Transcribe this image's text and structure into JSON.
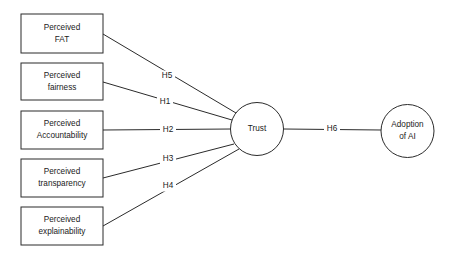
{
  "diagram": {
    "background_color": "#ffffff",
    "line_color": "#2b2b2b",
    "text_color": "#1a1a1a",
    "exogenous_boxes": [
      {
        "id": "perceived-fat",
        "line1": "Perceived",
        "line2": "FAT",
        "x": 21,
        "y": 14,
        "w": 82,
        "h": 39
      },
      {
        "id": "perceived-fairness",
        "line1": "Perceived",
        "line2": "fairness",
        "x": 21,
        "y": 63,
        "w": 82,
        "h": 37
      },
      {
        "id": "perceived-accountability",
        "line1": "Perceived",
        "line2": "Accountability",
        "x": 21,
        "y": 111,
        "w": 82,
        "h": 38
      },
      {
        "id": "perceived-transparency",
        "line1": "Perceived",
        "line2": "transparency",
        "x": 21,
        "y": 159,
        "w": 82,
        "h": 38
      },
      {
        "id": "perceived-explainability",
        "line1": "Perceived",
        "line2": "explainability",
        "x": 21,
        "y": 207,
        "w": 82,
        "h": 38
      }
    ],
    "circles": [
      {
        "id": "trust",
        "line1": "Trust",
        "line2": "",
        "cx": 257,
        "cy": 129,
        "r": 26.5
      },
      {
        "id": "adoption-of-ai",
        "line1": "Adoption",
        "line2": "of AI",
        "cx": 407.5,
        "cy": 131,
        "r": 26.5
      }
    ],
    "paths": [
      {
        "id": "h5",
        "label": "H5",
        "x1": 103,
        "y1": 34,
        "x2": 236,
        "y2": 113,
        "lx": 167,
        "ly": 76
      },
      {
        "id": "h1",
        "label": "H1",
        "x1": 103,
        "y1": 82,
        "x2": 232,
        "y2": 120,
        "lx": 165,
        "ly": 102
      },
      {
        "id": "h2",
        "label": "H2",
        "x1": 103,
        "y1": 130,
        "x2": 231,
        "y2": 129,
        "lx": 168,
        "ly": 130
      },
      {
        "id": "h3",
        "label": "H3",
        "x1": 103,
        "y1": 178,
        "x2": 234,
        "y2": 144,
        "lx": 168,
        "ly": 159
      },
      {
        "id": "h4",
        "label": "H4",
        "x1": 103,
        "y1": 226,
        "x2": 239,
        "y2": 149,
        "lx": 168,
        "ly": 186
      },
      {
        "id": "h6",
        "label": "H6",
        "x1": 284,
        "y1": 129,
        "x2": 381,
        "y2": 130,
        "lx": 332,
        "ly": 129
      }
    ]
  }
}
